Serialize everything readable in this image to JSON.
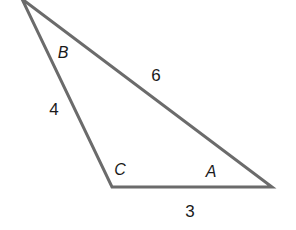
{
  "diagram": {
    "type": "triangle",
    "stroke_color": "#6b6b6b",
    "stroke_width": 3,
    "vertices": [
      {
        "name": "B",
        "x": 22,
        "y": -1
      },
      {
        "name": "C",
        "x": 112,
        "y": 187
      },
      {
        "name": "A",
        "x": 272,
        "y": 187
      }
    ],
    "angle_labels": {
      "B": "B",
      "C": "C",
      "A": "A"
    },
    "side_labels": {
      "BA": "6",
      "BC": "4",
      "CA": "3"
    }
  }
}
